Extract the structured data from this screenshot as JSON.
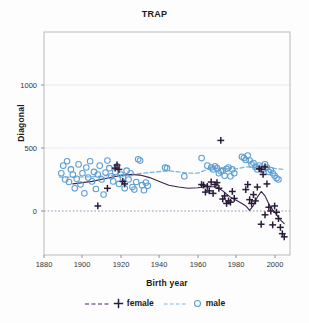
{
  "chart": {
    "title": "TRAP",
    "xlabel": "Birth year",
    "ylabel": "Diagonal"
  },
  "axes": {
    "xticks": [
      "1880",
      "1900",
      "1920",
      "1940",
      "1960",
      "1980",
      "2000"
    ],
    "yticks": [
      "0",
      "500",
      "1000"
    ]
  },
  "legend": {
    "items": [
      {
        "label": "female",
        "marker": "plus-marker",
        "line": "dashed-line",
        "color": "#4b2060"
      },
      {
        "label": "male",
        "marker": "circle-marker",
        "line": "dashed-line",
        "color": "#7fb6e0"
      }
    ]
  },
  "chart_data": {
    "type": "scatter",
    "title": "TRAP",
    "xlabel": "Birth year",
    "ylabel": "Diagonal",
    "xlim": [
      1875,
      2003
    ],
    "ylim": [
      -320,
      1180
    ],
    "xticks": [
      1880,
      1900,
      1920,
      1940,
      1960,
      1980,
      2000
    ],
    "yticks": [
      0,
      500,
      1000
    ],
    "grid": true,
    "legend_position": "below-axis",
    "zero_reference_line": 0,
    "colors": {
      "female": "#4b2060",
      "male": "#7fb6e0"
    },
    "series": [
      {
        "name": "male",
        "marker": "open-circle",
        "color": "#7fb6e0",
        "points": [
          [
            1884,
            300
          ],
          [
            1885,
            360
          ],
          [
            1886,
            250
          ],
          [
            1887,
            395
          ],
          [
            1888,
            230
          ],
          [
            1889,
            330
          ],
          [
            1890,
            290
          ],
          [
            1891,
            180
          ],
          [
            1892,
            255
          ],
          [
            1893,
            370
          ],
          [
            1894,
            210
          ],
          [
            1895,
            300
          ],
          [
            1896,
            140
          ],
          [
            1897,
            345
          ],
          [
            1898,
            265
          ],
          [
            1899,
            395
          ],
          [
            1900,
            235
          ],
          [
            1901,
            310
          ],
          [
            1902,
            175
          ],
          [
            1903,
            290
          ],
          [
            1904,
            360
          ],
          [
            1905,
            250
          ],
          [
            1906,
            130
          ],
          [
            1907,
            305
          ],
          [
            1908,
            400
          ],
          [
            1909,
            340
          ],
          [
            1910,
            275
          ],
          [
            1911,
            235
          ],
          [
            1912,
            310
          ],
          [
            1913,
            355
          ],
          [
            1914,
            215
          ],
          [
            1915,
            290
          ],
          [
            1916,
            265
          ],
          [
            1917,
            180
          ],
          [
            1918,
            320
          ],
          [
            1919,
            250
          ],
          [
            1920,
            300
          ],
          [
            1921,
            190
          ],
          [
            1922,
            170
          ],
          [
            1923,
            230
          ],
          [
            1924,
            410
          ],
          [
            1925,
            400
          ],
          [
            1926,
            205
          ],
          [
            1927,
            165
          ],
          [
            1928,
            225
          ],
          [
            1929,
            200
          ],
          [
            1938,
            345
          ],
          [
            1939,
            340
          ],
          [
            1948,
            275
          ],
          [
            1957,
            420
          ],
          [
            1960,
            360
          ],
          [
            1962,
            345
          ],
          [
            1963,
            330
          ],
          [
            1964,
            355
          ],
          [
            1965,
            340
          ],
          [
            1966,
            300
          ],
          [
            1967,
            315
          ],
          [
            1968,
            320
          ],
          [
            1969,
            280
          ],
          [
            1970,
            335
          ],
          [
            1971,
            345
          ],
          [
            1972,
            275
          ],
          [
            1973,
            330
          ],
          [
            1974,
            300
          ],
          [
            1978,
            430
          ],
          [
            1979,
            420
          ],
          [
            1980,
            405
          ],
          [
            1981,
            440
          ],
          [
            1982,
            400
          ],
          [
            1983,
            370
          ],
          [
            1984,
            380
          ],
          [
            1985,
            350
          ],
          [
            1986,
            330
          ],
          [
            1987,
            360
          ],
          [
            1988,
            345
          ],
          [
            1989,
            330
          ],
          [
            1990,
            370
          ],
          [
            1991,
            345
          ],
          [
            1992,
            310
          ],
          [
            1993,
            325
          ],
          [
            1994,
            300
          ],
          [
            1995,
            280
          ],
          [
            1996,
            260
          ],
          [
            1997,
            250
          ]
        ]
      },
      {
        "name": "female",
        "marker": "plus",
        "color": "#2b1b3a",
        "points": [
          [
            1903,
            40
          ],
          [
            1912,
            340
          ],
          [
            1913,
            365
          ],
          [
            1914,
            330
          ],
          [
            1916,
            235
          ],
          [
            1917,
            215
          ],
          [
            1908,
            180
          ],
          [
            1957,
            210
          ],
          [
            1958,
            205
          ],
          [
            1959,
            150
          ],
          [
            1960,
            195
          ],
          [
            1961,
            160
          ],
          [
            1962,
            230
          ],
          [
            1963,
            140
          ],
          [
            1964,
            210
          ],
          [
            1965,
            225
          ],
          [
            1966,
            180
          ],
          [
            1967,
            560
          ],
          [
            1968,
            95
          ],
          [
            1969,
            120
          ],
          [
            1970,
            60
          ],
          [
            1971,
            80
          ],
          [
            1972,
            70
          ],
          [
            1973,
            155
          ],
          [
            1974,
            100
          ],
          [
            1980,
            170
          ],
          [
            1981,
            210
          ],
          [
            1982,
            90
          ],
          [
            1983,
            60
          ],
          [
            1984,
            130
          ],
          [
            1985,
            80
          ],
          [
            1986,
            190
          ],
          [
            1987,
            335
          ],
          [
            1988,
            330
          ],
          [
            1989,
            290
          ],
          [
            1990,
            350
          ],
          [
            1991,
            215
          ],
          [
            1992,
            30
          ],
          [
            1993,
            0
          ],
          [
            1994,
            -110
          ],
          [
            1995,
            40
          ],
          [
            1996,
            -10
          ],
          [
            1997,
            -60
          ],
          [
            1998,
            -130
          ],
          [
            1999,
            -180
          ],
          [
            2000,
            -205
          ],
          [
            1988,
            -105
          ],
          [
            1990,
            -30
          ]
        ]
      }
    ],
    "trend_lines": [
      {
        "name": "male",
        "color": "#7fb6e0",
        "style": "dashed",
        "points": [
          [
            1883,
            270
          ],
          [
            1890,
            268
          ],
          [
            1900,
            272
          ],
          [
            1910,
            282
          ],
          [
            1920,
            290
          ],
          [
            1930,
            305
          ],
          [
            1940,
            320
          ],
          [
            1950,
            300
          ],
          [
            1955,
            300
          ],
          [
            1960,
            330
          ],
          [
            1965,
            340
          ],
          [
            1970,
            338
          ],
          [
            1975,
            335
          ],
          [
            1980,
            350
          ],
          [
            1985,
            345
          ],
          [
            1990,
            345
          ],
          [
            1995,
            338
          ],
          [
            2000,
            330
          ]
        ]
      },
      {
        "name": "female",
        "color": "#3a2250",
        "style": "solid",
        "points": [
          [
            1890,
            215
          ],
          [
            1900,
            235
          ],
          [
            1910,
            268
          ],
          [
            1915,
            282
          ],
          [
            1920,
            290
          ],
          [
            1925,
            285
          ],
          [
            1930,
            265
          ],
          [
            1935,
            235
          ],
          [
            1940,
            205
          ],
          [
            1945,
            190
          ],
          [
            1950,
            180
          ],
          [
            1955,
            185
          ],
          [
            1960,
            195
          ],
          [
            1965,
            190
          ],
          [
            1968,
            160
          ],
          [
            1972,
            110
          ],
          [
            1975,
            85
          ],
          [
            1978,
            60
          ],
          [
            1980,
            40
          ],
          [
            1982,
            5
          ],
          [
            1984,
            45
          ],
          [
            1986,
            110
          ],
          [
            1988,
            155
          ],
          [
            1990,
            120
          ],
          [
            1992,
            55
          ],
          [
            1994,
            10
          ],
          [
            1996,
            -30
          ],
          [
            1998,
            -70
          ],
          [
            2000,
            -100
          ]
        ]
      }
    ]
  }
}
